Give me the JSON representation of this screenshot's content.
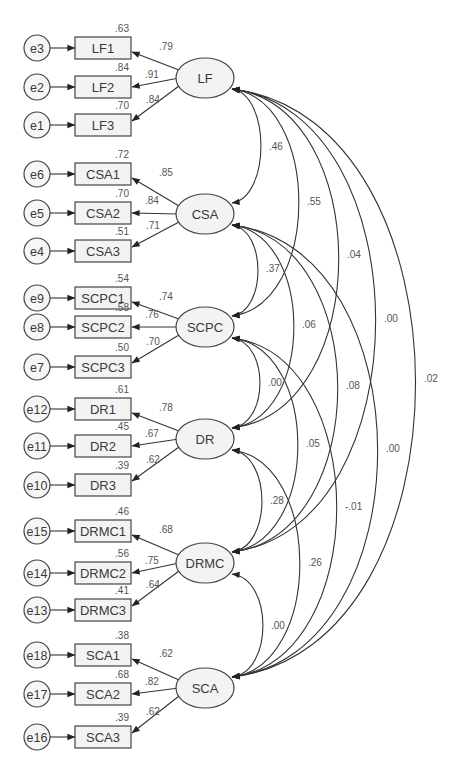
{
  "diagram": {
    "type": "SEM path diagram (confirmatory factor analysis, standardized estimates)",
    "latents": [
      {
        "id": "LF",
        "label": "LF",
        "cy": 78,
        "indicators": [
          {
            "label": "LF1",
            "error": "e3",
            "loading": ".79",
            "r2": ".63"
          },
          {
            "label": "LF2",
            "error": "e2",
            "loading": ".91",
            "r2": ".84"
          },
          {
            "label": "LF3",
            "error": "e1",
            "loading": ".84",
            "r2": ".70"
          }
        ]
      },
      {
        "id": "CSA",
        "label": "CSA",
        "cy": 214,
        "indicators": [
          {
            "label": "CSA1",
            "error": "e6",
            "loading": ".85",
            "r2": ".72"
          },
          {
            "label": "CSA2",
            "error": "e5",
            "loading": ".84",
            "r2": ".70"
          },
          {
            "label": "CSA3",
            "error": "e4",
            "loading": ".71",
            "r2": ".51"
          }
        ]
      },
      {
        "id": "SCPC",
        "label": "SCPC",
        "cy": 327,
        "indicators": [
          {
            "label": "SCPC1",
            "error": "e9",
            "loading": ".74",
            "r2": ".54"
          },
          {
            "label": "SCPC2",
            "error": "e8",
            "loading": ".76",
            "r2": ".58"
          },
          {
            "label": "SCPC3",
            "error": "e7",
            "loading": ".70",
            "r2": ".50"
          }
        ]
      },
      {
        "id": "DR",
        "label": "DR",
        "cy": 439,
        "indicators": [
          {
            "label": "DR1",
            "error": "e12",
            "loading": ".78",
            "r2": ".61"
          },
          {
            "label": "DR2",
            "error": "e11",
            "loading": ".67",
            "r2": ".45"
          },
          {
            "label": "DR3",
            "error": "e10",
            "loading": ".62",
            "r2": ".39"
          }
        ]
      },
      {
        "id": "DRMC",
        "label": "DRMC",
        "cy": 563,
        "indicators": [
          {
            "label": "DRMC1",
            "error": "e15",
            "loading": ".68",
            "r2": ".46"
          },
          {
            "label": "DRMC2",
            "error": "e14",
            "loading": ".75",
            "r2": ".56"
          },
          {
            "label": "DRMC3",
            "error": "e13",
            "loading": ".64",
            "r2": ".41"
          }
        ]
      },
      {
        "id": "SCA",
        "label": "SCA",
        "cy": 688,
        "indicators": [
          {
            "label": "SCA1",
            "error": "e18",
            "loading": ".62",
            "r2": ".38"
          },
          {
            "label": "SCA2",
            "error": "e17",
            "loading": ".82",
            "r2": ".68"
          },
          {
            "label": "SCA3",
            "error": "e16",
            "loading": ".62",
            "r2": ".39"
          }
        ]
      }
    ],
    "indicator_rows_y": [
      [
        48,
        87,
        125
      ],
      [
        174,
        213,
        251
      ],
      [
        298,
        327,
        367
      ],
      [
        409,
        446,
        485
      ],
      [
        531,
        573,
        610
      ],
      [
        655,
        694,
        737
      ]
    ],
    "covariances": [
      {
        "from": "LF",
        "to": "CSA",
        "value": ".46"
      },
      {
        "from": "LF",
        "to": "SCPC",
        "value": ".55"
      },
      {
        "from": "LF",
        "to": "DR",
        "value": ".04"
      },
      {
        "from": "LF",
        "to": "DRMC",
        "value": ".00"
      },
      {
        "from": "LF",
        "to": "SCA",
        "value": ".02"
      },
      {
        "from": "CSA",
        "to": "SCPC",
        "value": ".37"
      },
      {
        "from": "CSA",
        "to": "DR",
        "value": ".06"
      },
      {
        "from": "CSA",
        "to": "DRMC",
        "value": ".08"
      },
      {
        "from": "CSA",
        "to": "SCA",
        "value": ".00"
      },
      {
        "from": "SCPC",
        "to": "DR",
        "value": ".00"
      },
      {
        "from": "SCPC",
        "to": "DRMC",
        "value": ".05"
      },
      {
        "from": "SCPC",
        "to": "SCA",
        "value": "-.01"
      },
      {
        "from": "DR",
        "to": "DRMC",
        "value": ".28"
      },
      {
        "from": "DR",
        "to": "SCA",
        "value": ".26"
      },
      {
        "from": "DRMC",
        "to": "SCA",
        "value": ".00"
      }
    ],
    "covariance_label_positions": {
      "LF-CSA": [
        269,
        150
      ],
      "LF-SCPC": [
        307,
        205
      ],
      "LF-DR": [
        347,
        258
      ],
      "LF-DRMC": [
        384,
        322
      ],
      "LF-SCA": [
        424,
        382
      ],
      "CSA-SCPC": [
        266,
        272
      ],
      "CSA-DR": [
        302,
        328
      ],
      "CSA-DRMC": [
        346,
        389
      ],
      "CSA-SCA": [
        386,
        452
      ],
      "SCPC-DR": [
        268,
        386
      ],
      "SCPC-DRMC": [
        306,
        447
      ],
      "SCPC-SCA": [
        345,
        510
      ],
      "DR-DRMC": [
        270,
        504
      ],
      "DR-SCA": [
        308,
        566
      ],
      "DRMC-SCA": [
        271,
        629
      ]
    }
  }
}
